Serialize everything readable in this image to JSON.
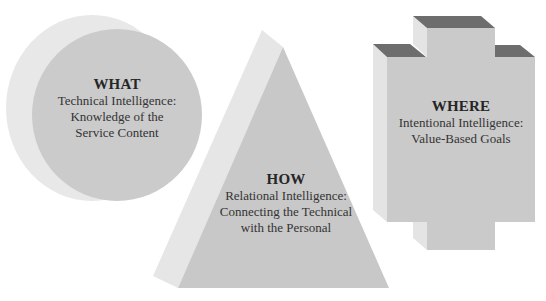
{
  "diagram": {
    "colors": {
      "background": "#ffffff",
      "light_face": "#e6e6e6",
      "main_face": "#c9c9c9",
      "dark_top": "#6e6e6e",
      "text": "#2a2a2a"
    },
    "shapes": [
      {
        "id": "what",
        "shape": "circle",
        "title": "WHAT",
        "lines": [
          "Technical Intelligence:",
          "Knowledge of the",
          "Service Content"
        ]
      },
      {
        "id": "how",
        "shape": "pyramid",
        "title": "HOW",
        "lines": [
          "Relational Intelligence:",
          "Connecting the Technical",
          "with the Personal"
        ]
      },
      {
        "id": "where",
        "shape": "cross",
        "title": "WHERE",
        "lines": [
          "Intentional Intelligence:",
          "Value-Based Goals"
        ]
      }
    ]
  }
}
